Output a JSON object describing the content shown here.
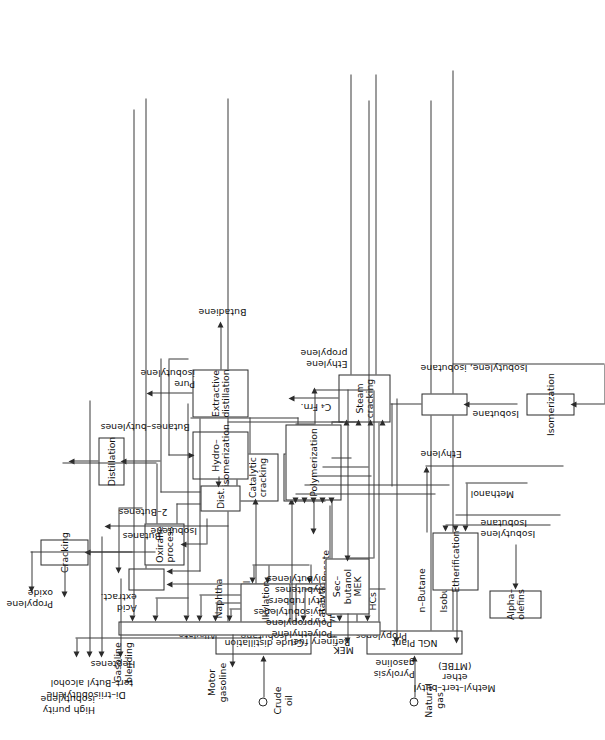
{
  "diagram": {
    "orientation": "rotated-90-ccw",
    "line_color": "#3a3a3a",
    "box_border_color": "#2b2b2b",
    "background": "#ffffff"
  },
  "process_units": [
    {
      "id": "crude-distillation",
      "label": "Crude distillation"
    },
    {
      "id": "ngl-plant",
      "label": "NGL Plant"
    },
    {
      "id": "catalytic-cracking",
      "label": "Catalytic\ncracking"
    },
    {
      "id": "thermal-cracking",
      "label": "Thermal\ncracking"
    },
    {
      "id": "steam-cracking",
      "label": "Steam\ncracking"
    },
    {
      "id": "dist",
      "label": "Dist."
    },
    {
      "id": "hydro-isomerization",
      "label": "Hydro–\nisomerization"
    },
    {
      "id": "extractive-distillation",
      "label": "Extractive\ndistillation"
    },
    {
      "id": "distillation",
      "label": "Distillation"
    },
    {
      "id": "acid-extraction",
      "label": ""
    },
    {
      "id": "alkylation",
      "label": "Alkylation"
    },
    {
      "id": "catalytic-polymerization",
      "label": "Catalytic\npolymerization"
    },
    {
      "id": "gasoline-blending",
      "label": ""
    },
    {
      "id": "cracking",
      "label": "Cracking"
    },
    {
      "id": "oxirane-process",
      "label": "Oxirane\nprocess"
    },
    {
      "id": "polymerization",
      "label": "Polymerization"
    },
    {
      "id": "sec-butanol-mek",
      "label": "Sec–butanol\nMEK"
    },
    {
      "id": "etherification",
      "label": "Etherification"
    },
    {
      "id": "isomerization",
      "label": "Isomerization"
    },
    {
      "id": "dehydrogenation",
      "label": ""
    },
    {
      "id": "alpha-olefins-unit",
      "label": "Alpha–olefins"
    }
  ],
  "feeds": [
    {
      "id": "crude-oil",
      "label": "Crude\noil"
    },
    {
      "id": "natural-gas",
      "label": "Natural\ngas"
    }
  ],
  "stream_labels": {
    "naphtha": "Naphtha",
    "gas_oil": "Gas oil",
    "resid": "Resid.",
    "field_condensate": "Field\ncondensate",
    "c2_heavier": "C₂\nHeavier\nHCs",
    "n_butane": "n–Butane",
    "isobutane_ngl": "Isobutane",
    "butanes_butylenes": "Butanes–butylenes",
    "c4_frn": "C₄ Frn.",
    "two_butenes": "2–Butenes",
    "pure_isobutylene": "Pure\nisobutylene",
    "butadiene": "Butadiene",
    "ethylene_propylene": "Ethylene\npropylene",
    "refinery_fuel_lpg": "Refinery fuel\nLPG",
    "isobutane_alky": "Isobutane",
    "propylenes": "Propylenes",
    "acid_extract": "Acid\nextract.",
    "alkylate": "Alkylate",
    "butanes": "Butanes",
    "isobutene": "Isobutene",
    "isobutylene_ether": "Isobutylene",
    "isobutane_ether": "Isobutane",
    "methanol": "Methanol",
    "isobutane_dehydro": "Isobutane",
    "isobutylene_isobutane": "Isobutylene, isobutane",
    "ethylene": "Ethylene"
  },
  "products": {
    "motor_gasoline": "Motor\ngasoline",
    "heptenes": "Heptenes",
    "tert_butyl_alcohol": "tert–Butyl alcohol",
    "di_triisobutylene": "Di–triisobutylene",
    "high_purity_isobutylene": "High purity\nisobutylene",
    "propylene_oxide": "Propylene\noxide",
    "polymers": "Polyethylene\nPolypropylene\nPolyisobutylenes\nButyl rubbers\nPolybutenes\nPolybutylenes",
    "mek": "MEK",
    "pyrolysis_gasoline": "Pyrolysis\ngasoline",
    "mtbe": "Methyl–tert–butyl ether\n(MTBE)",
    "gasoline_blending": "Gasoline\nblending",
    "alpha_olefins": "Alpha–olefins"
  }
}
